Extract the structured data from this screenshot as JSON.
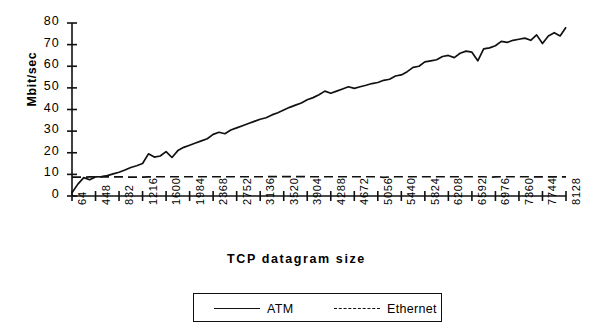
{
  "chart_data": {
    "type": "line",
    "title": "",
    "xlabel": "TCP datagram size",
    "ylabel": "Mbit/sec",
    "ylim": [
      0,
      80
    ],
    "yticks": [
      0,
      10,
      20,
      30,
      40,
      50,
      60,
      70,
      80
    ],
    "grid": false,
    "legend_position": "bottom",
    "xtick_labels": [
      "64",
      "448",
      "832",
      "1216",
      "1600",
      "1984",
      "2368",
      "2752",
      "3136",
      "3520",
      "3904",
      "4288",
      "4672",
      "5056",
      "5440",
      "5824",
      "6208",
      "6592",
      "6976",
      "7360",
      "7744",
      "8128"
    ],
    "xtick_values": [
      64,
      448,
      832,
      1216,
      1600,
      1984,
      2368,
      2752,
      3136,
      3520,
      3904,
      4288,
      4672,
      5056,
      5440,
      5824,
      6208,
      6592,
      6976,
      7360,
      7744,
      8128
    ],
    "x": [
      64,
      160,
      256,
      352,
      448,
      544,
      640,
      736,
      832,
      928,
      1024,
      1120,
      1216,
      1312,
      1408,
      1504,
      1600,
      1696,
      1792,
      1888,
      1984,
      2080,
      2176,
      2272,
      2368,
      2464,
      2560,
      2656,
      2752,
      2848,
      2944,
      3040,
      3136,
      3232,
      3328,
      3424,
      3520,
      3616,
      3712,
      3808,
      3904,
      4000,
      4096,
      4192,
      4288,
      4384,
      4480,
      4576,
      4672,
      4768,
      4864,
      4960,
      5056,
      5152,
      5248,
      5344,
      5440,
      5536,
      5632,
      5728,
      5824,
      5920,
      6016,
      6112,
      6208,
      6304,
      6400,
      6496,
      6592,
      6688,
      6784,
      6880,
      6976,
      7072,
      7168,
      7264,
      7360,
      7456,
      7552,
      7648,
      7744,
      7840,
      7936,
      8032,
      8128
    ],
    "series": [
      {
        "name": "ATM",
        "style": "solid",
        "values": [
          1.5,
          5.5,
          8.5,
          7.5,
          8.8,
          9.0,
          9.4,
          10.2,
          11.0,
          12.0,
          13.2,
          14.0,
          15.0,
          19.5,
          18.0,
          18.5,
          20.5,
          17.8,
          21.0,
          22.5,
          23.5,
          24.5,
          25.5,
          26.5,
          28.5,
          29.5,
          28.8,
          30.5,
          31.5,
          32.5,
          33.5,
          34.5,
          35.5,
          36.2,
          37.5,
          38.5,
          39.8,
          41.0,
          42.0,
          43.0,
          44.5,
          45.5,
          46.8,
          48.5,
          47.5,
          48.5,
          49.5,
          50.5,
          49.8,
          50.5,
          51.2,
          52.0,
          52.5,
          53.5,
          54.0,
          55.5,
          56.0,
          57.5,
          59.5,
          60.0,
          62.0,
          62.5,
          63.0,
          64.5,
          65.0,
          64.0,
          66.0,
          67.0,
          66.5,
          62.5,
          68.0,
          68.5,
          69.5,
          71.5,
          71.0,
          72.0,
          72.5,
          73.0,
          72.0,
          74.5,
          70.5,
          74.0,
          75.5,
          74.0,
          78.0
        ]
      },
      {
        "name": "Ethernet",
        "style": "dashed",
        "values": [
          8.7,
          8.7,
          8.7,
          8.8,
          8.8,
          8.8,
          8.8,
          8.8,
          8.8,
          8.8,
          8.7,
          8.7,
          8.7,
          8.8,
          8.9,
          8.9,
          8.9,
          8.9,
          8.9,
          8.9,
          8.9,
          8.9,
          8.9,
          8.9,
          8.9,
          8.9,
          8.9,
          8.9,
          8.9,
          8.9,
          8.9,
          8.9,
          8.9,
          8.9,
          9.0,
          9.0,
          9.0,
          9.0,
          9.0,
          9.0,
          8.9,
          8.9,
          8.9,
          8.9,
          8.9,
          8.9,
          8.9,
          8.9,
          8.9,
          8.9,
          8.9,
          8.9,
          8.9,
          8.6,
          8.8,
          8.9,
          8.9,
          8.9,
          8.9,
          8.9,
          8.9,
          8.9,
          8.9,
          8.9,
          8.9,
          8.9,
          8.9,
          8.9,
          8.9,
          8.9,
          8.9,
          8.7,
          8.8,
          8.9,
          8.9,
          8.9,
          8.9,
          8.9,
          8.9,
          8.8,
          8.8,
          8.8,
          8.8,
          8.8,
          8.8
        ]
      }
    ]
  },
  "legend": {
    "entries": [
      {
        "label": "ATM",
        "style": "solid"
      },
      {
        "label": "Ethernet",
        "style": "dashed"
      }
    ]
  },
  "colors": {
    "line": "#111111",
    "axis": "#111111",
    "background": "#ffffff"
  }
}
